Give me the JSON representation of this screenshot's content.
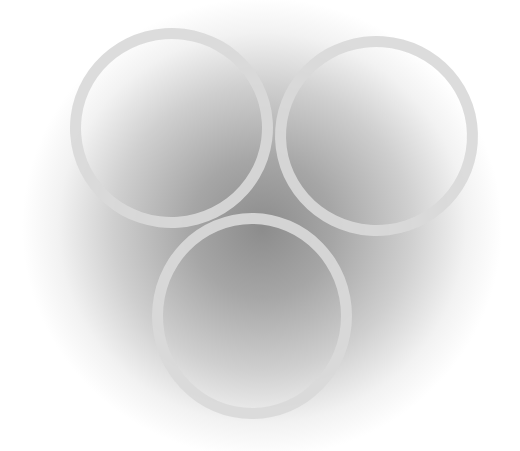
{
  "image": {
    "description": "Three pale translucent rings arranged in a triangle on a soft radial gray gradient background",
    "rings": [
      {
        "position": "top-left"
      },
      {
        "position": "top-right"
      },
      {
        "position": "bottom-center"
      }
    ],
    "colors": {
      "ring": "#d9d9d9",
      "background_center": "#8c8c8c",
      "background_edge": "#ffffff"
    }
  }
}
